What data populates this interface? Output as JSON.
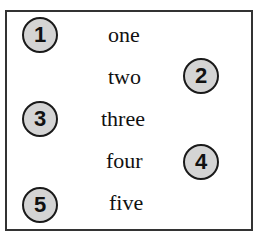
{
  "items": [
    {
      "number": "1",
      "word": "one"
    },
    {
      "number": "2",
      "word": "two"
    },
    {
      "number": "3",
      "word": "three"
    },
    {
      "number": "4",
      "word": "four"
    },
    {
      "number": "5",
      "word": "five"
    }
  ]
}
